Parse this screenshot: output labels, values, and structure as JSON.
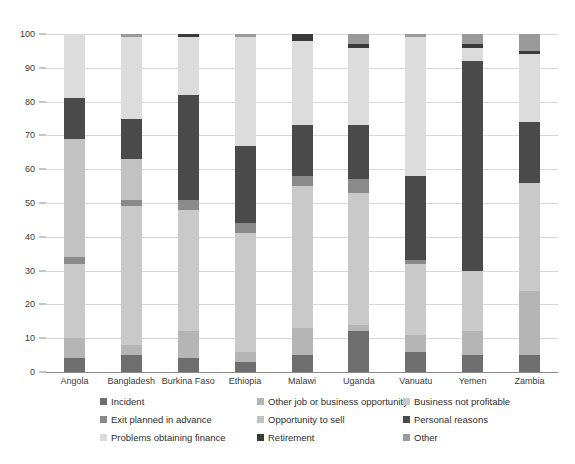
{
  "chart_data": {
    "type": "bar",
    "subtype": "stacked-bar-100",
    "title": "",
    "subtitle": "",
    "xlabel": "",
    "ylabel": "",
    "ylim": [
      0,
      100
    ],
    "yticks": [
      0,
      10,
      20,
      30,
      40,
      50,
      60,
      70,
      80,
      90,
      100
    ],
    "ytick_labels": [
      "0",
      "10",
      "20",
      "30",
      "40",
      "50",
      "60",
      "70",
      "80",
      "90",
      "100"
    ],
    "grid": true,
    "legend_position": "bottom",
    "categories": [
      "Angola",
      "Bangladesh",
      "Burkina Faso",
      "Ethiopia",
      "Malawi",
      "Uganda",
      "Vanuatu",
      "Yemen",
      "Zambia"
    ],
    "series": [
      {
        "name": "Incident",
        "color": "#6e6e6e",
        "values": [
          4,
          5,
          4,
          3,
          5,
          12,
          6,
          5,
          5
        ]
      },
      {
        "name": "Other job or business opportunity",
        "color": "#b5b5b5",
        "values": [
          6,
          3,
          8,
          3,
          8,
          2,
          5,
          7,
          19
        ]
      },
      {
        "name": "Business not profitable",
        "color": "#c9c9c9",
        "values": [
          22,
          41,
          36,
          35,
          42,
          39,
          21,
          18,
          32
        ]
      },
      {
        "name": "Exit planned in advance",
        "color": "#8a8a8a",
        "values": [
          2,
          2,
          3,
          3,
          3,
          4,
          1,
          0,
          0
        ]
      },
      {
        "name": "Opportunity to sell",
        "color": "#c2c2c2",
        "values": [
          35,
          12,
          0,
          0,
          0,
          0,
          0,
          0,
          0
        ]
      },
      {
        "name": "Personal reasons",
        "color": "#4a4a4a",
        "values": [
          12,
          12,
          31,
          23,
          15,
          16,
          25,
          62,
          18
        ]
      },
      {
        "name": "Problems obtaining finance",
        "color": "#dcdcdc",
        "values": [
          19,
          24,
          17,
          32,
          25,
          23,
          41,
          4,
          20
        ]
      },
      {
        "name": "Retirement",
        "color": "#3a3a3a",
        "values": [
          0,
          0,
          1,
          0,
          2,
          1,
          0,
          1,
          1
        ]
      },
      {
        "name": "Other",
        "color": "#9a9a9a",
        "values": [
          0,
          1,
          0,
          1,
          0,
          3,
          1,
          3,
          5
        ]
      }
    ],
    "stack_order": [
      "Incident",
      "Other job or business opportunity",
      "Business not profitable",
      "Exit planned in advance",
      "Opportunity to sell",
      "Personal reasons",
      "Problems obtaining finance",
      "Retirement",
      "Other"
    ],
    "legend_layout": {
      "columns": 3,
      "rows": 3,
      "order": [
        "Incident",
        "Other job or business opportunity",
        "Business not profitable",
        "Exit planned in advance",
        "Opportunity to sell",
        "Personal reasons",
        "Problems obtaining finance",
        "Retirement",
        "Other"
      ]
    }
  }
}
